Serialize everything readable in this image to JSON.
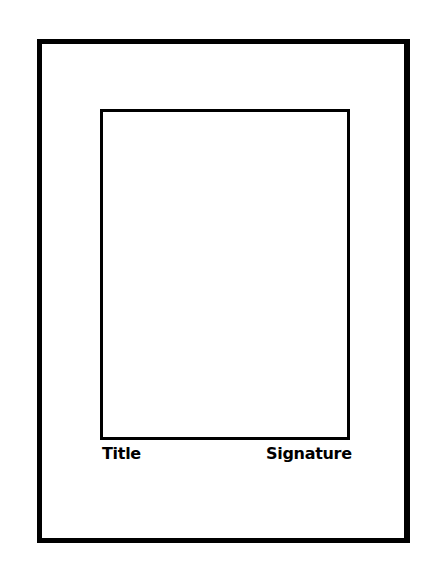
{
  "diagram": {
    "labels": {
      "title": "Title",
      "signature": "Signature"
    },
    "colors": {
      "line": "#000000",
      "background": "#ffffff"
    }
  }
}
